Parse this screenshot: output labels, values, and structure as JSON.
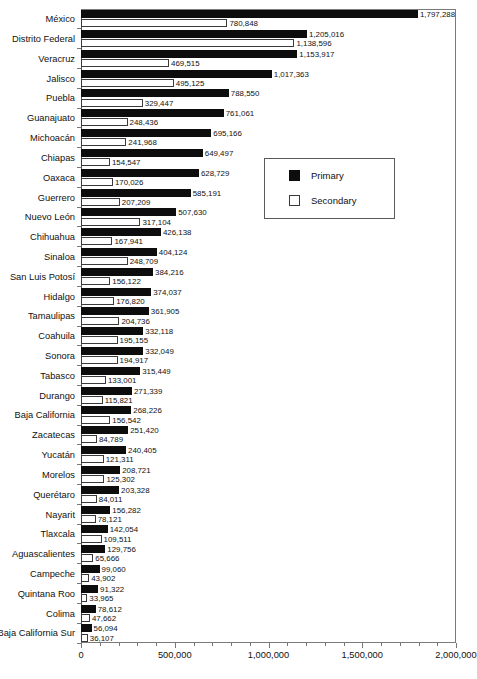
{
  "chart_data": {
    "type": "bar",
    "orientation": "horizontal",
    "title": "",
    "xlabel": "",
    "ylabel": "",
    "xlim": [
      0,
      2000000
    ],
    "grid": false,
    "legend_position": "center-right",
    "axis_ticks": [
      "0",
      "500,000",
      "1,000,000",
      "1,500,000",
      "2,000,000"
    ],
    "axis_tick_values": [
      0,
      500000,
      1000000,
      1500000,
      2000000
    ],
    "categories": [
      "México",
      "Distrito Federal",
      "Veracruz",
      "Jalisco",
      "Puebla",
      "Guanajuato",
      "Michoacán",
      "Chiapas",
      "Oaxaca",
      "Guerrero",
      "Nuevo León",
      "Chihuahua",
      "Sinaloa",
      "San Luis Potosí",
      "Hidalgo",
      "Tamaulipas",
      "Coahuila",
      "Sonora",
      "Tabasco",
      "Durango",
      "Baja California",
      "Zacatecas",
      "Yucatán",
      "Morelos",
      "Querétaro",
      "Nayarit",
      "Tlaxcala",
      "Aguascalientes",
      "Campeche",
      "Quintana Roo",
      "Colima",
      "Baja California Sur"
    ],
    "series": [
      {
        "name": "Primary",
        "color": "#0d0d0d",
        "values": [
          1797288,
          1205016,
          1153917,
          1017363,
          788550,
          761061,
          695166,
          649497,
          628729,
          585191,
          507630,
          426138,
          404124,
          384216,
          374037,
          361905,
          332118,
          332049,
          315449,
          271339,
          268226,
          251420,
          240405,
          208721,
          203328,
          156282,
          142054,
          129756,
          99060,
          91322,
          78612,
          56094
        ],
        "labels": [
          "1,797,288",
          "1,205,016",
          "1,153,917",
          "1,017,363",
          "788,550",
          "761,061",
          "695,166",
          "649,497",
          "628,729",
          "585,191",
          "507,630",
          "426,138",
          "404,124",
          "384,216",
          "374,037",
          "361,905",
          "332,118",
          "332,049",
          "315,449",
          "271,339",
          "268,226",
          "251,420",
          "240,405",
          "208,721",
          "203,328",
          "156,282",
          "142,054",
          "129,756",
          "99,060",
          "91,322",
          "78,612",
          "56,094"
        ]
      },
      {
        "name": "Secondary",
        "color": "#ffffff",
        "values": [
          780848,
          1138596,
          469515,
          495125,
          329447,
          248436,
          241968,
          154547,
          170026,
          207209,
          317104,
          167941,
          248709,
          156122,
          176820,
          204736,
          195155,
          194917,
          133001,
          115821,
          156542,
          84789,
          121311,
          125302,
          84011,
          78121,
          109511,
          65666,
          43902,
          33965,
          47662,
          36107
        ],
        "labels": [
          "780,848",
          "1,138,596",
          "469,515",
          "495,125",
          "329,447",
          "248,436",
          "241,968",
          "154,547",
          "170,026",
          "207,209",
          "317,104",
          "167,941",
          "248,709",
          "156,122",
          "176,820",
          "204,736",
          "195,155",
          "194,917",
          "133,001",
          "115,821",
          "156,542",
          "84,789",
          "121,311",
          "125,302",
          "84,011",
          "78,121",
          "109,511",
          "65,666",
          "43,902",
          "33,965",
          "47,662",
          "36,107"
        ]
      }
    ],
    "legend": [
      {
        "label": "Primary",
        "swatch": "filled"
      },
      {
        "label": "Secondary",
        "swatch": "hollow"
      }
    ]
  }
}
